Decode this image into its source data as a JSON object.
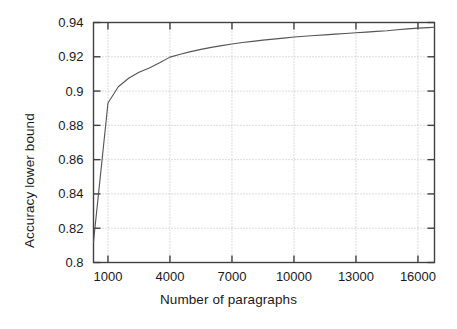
{
  "chart_data": {
    "type": "line",
    "title": "",
    "xlabel": "Number of paragraphs",
    "ylabel": "Accuracy lower bound",
    "xlim": [
      300,
      16800
    ],
    "ylim": [
      0.8,
      0.94
    ],
    "xticks": [
      1000,
      4000,
      7000,
      10000,
      13000,
      16000
    ],
    "xtick_labels": [
      "1000",
      "4000",
      "7000",
      "10000",
      "13000",
      "16000"
    ],
    "yticks": [
      0.8,
      0.82,
      0.84,
      0.86,
      0.88,
      0.9,
      0.92,
      0.94
    ],
    "ytick_labels": [
      "0.8",
      "0.82",
      "0.84",
      "0.86",
      "0.88",
      "0.9",
      "0.92",
      "0.94"
    ],
    "grid": true,
    "grid_style": "dotted",
    "legend": "none",
    "series": [
      {
        "name": "Accuracy lower bound",
        "color": "#555555",
        "x": [
          300,
          1000,
          1500,
          2000,
          2500,
          3000,
          3500,
          4000,
          4500,
          5000,
          5500,
          6000,
          6500,
          7000,
          7500,
          8000,
          8500,
          9000,
          9500,
          10000,
          10500,
          11000,
          11500,
          12000,
          12500,
          13000,
          13500,
          14000,
          14500,
          15000,
          15500,
          16000,
          16500,
          16800
        ],
        "y": [
          0.812,
          0.893,
          0.9025,
          0.9075,
          0.911,
          0.9135,
          0.9165,
          0.9198,
          0.9215,
          0.923,
          0.9243,
          0.9255,
          0.9265,
          0.9275,
          0.9283,
          0.929,
          0.9297,
          0.9303,
          0.9309,
          0.9315,
          0.932,
          0.9324,
          0.9328,
          0.9332,
          0.9336,
          0.934,
          0.9344,
          0.9348,
          0.9352,
          0.9358,
          0.9363,
          0.9367,
          0.937,
          0.9372
        ]
      }
    ]
  },
  "figure": {
    "background_color": "#ffffff",
    "axis_color": "#404040",
    "grid_color": "#b8b8b8"
  }
}
